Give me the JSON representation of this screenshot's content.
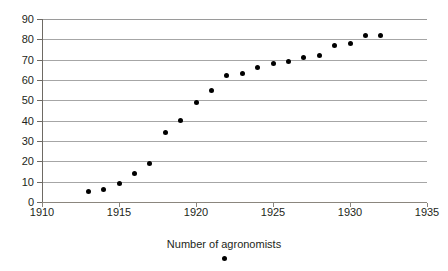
{
  "chart_data": {
    "type": "scatter",
    "title": "",
    "xlabel": "Number of agronomists",
    "ylabel": "",
    "xlim": [
      1910,
      1935
    ],
    "ylim": [
      0,
      90
    ],
    "x_ticks": [
      1910,
      1915,
      1920,
      1925,
      1930,
      1935
    ],
    "y_ticks": [
      0,
      10,
      20,
      30,
      40,
      50,
      60,
      70,
      80,
      90
    ],
    "grid": "horizontal",
    "legend": "below-axis-title",
    "series": [
      {
        "name": "Number of agronomists",
        "marker": "filled-circle",
        "color": "#000000",
        "x": [
          1913,
          1914,
          1915,
          1916,
          1917,
          1918,
          1919,
          1920,
          1921,
          1922,
          1923,
          1924,
          1925,
          1926,
          1927,
          1928,
          1929,
          1930,
          1931,
          1932
        ],
        "values": [
          5,
          6,
          9,
          14,
          19,
          34,
          40,
          49,
          55,
          62,
          63,
          66,
          68,
          69,
          71,
          72,
          77,
          78,
          82,
          82
        ]
      }
    ]
  },
  "axis_title": "Number of agronomists",
  "colors": {
    "gridline": "#a6a6a6",
    "axis": "#6e6a64",
    "marker": "#000000",
    "text": "#231f20",
    "background": "#ffffff"
  }
}
